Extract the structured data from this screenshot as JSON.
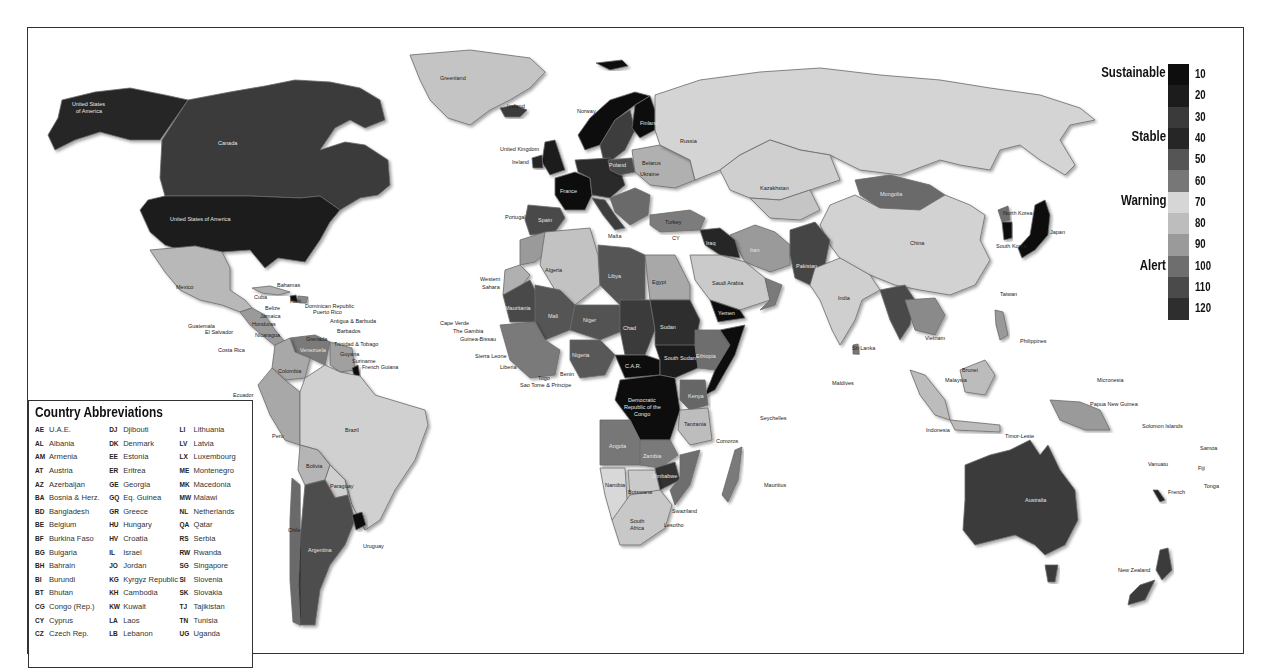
{
  "legend": {
    "categories": [
      {
        "label": "Sustainable",
        "top": 0
      },
      {
        "label": "Stable",
        "top": 64
      },
      {
        "label": "Warning",
        "top": 128
      },
      {
        "label": "Alert",
        "top": 193
      }
    ],
    "scale": [
      {
        "value": "10",
        "color": "#0e0e0e"
      },
      {
        "value": "20",
        "color": "#1c1c1c"
      },
      {
        "value": "30",
        "color": "#3a3a3a"
      },
      {
        "value": "40",
        "color": "#262626"
      },
      {
        "value": "50",
        "color": "#555555"
      },
      {
        "value": "60",
        "color": "#777777"
      },
      {
        "value": "70",
        "color": "#d6d6d6"
      },
      {
        "value": "80",
        "color": "#bdbdbd"
      },
      {
        "value": "90",
        "color": "#9a9a9a"
      },
      {
        "value": "100",
        "color": "#6e6e6e"
      },
      {
        "value": "110",
        "color": "#4a4a4a"
      },
      {
        "value": "120",
        "color": "#2e2e2e"
      }
    ]
  },
  "abbreviations": {
    "title": "Country Abbreviations",
    "columns": [
      [
        {
          "code": "AE",
          "name": "U.A.E."
        },
        {
          "code": "AL",
          "name": "Albania"
        },
        {
          "code": "AM",
          "name": "Armenia"
        },
        {
          "code": "AT",
          "name": "Austria"
        },
        {
          "code": "AZ",
          "name": "Azerbaijan"
        },
        {
          "code": "BA",
          "name": "Bosnia & Herz."
        },
        {
          "code": "BD",
          "name": "Bangladesh"
        },
        {
          "code": "BE",
          "name": "Belgium"
        },
        {
          "code": "BF",
          "name": "Burkina Faso"
        },
        {
          "code": "BG",
          "name": "Bulgaria"
        },
        {
          "code": "BH",
          "name": "Bahrain"
        },
        {
          "code": "BI",
          "name": "Burundi"
        },
        {
          "code": "BT",
          "name": "Bhutan"
        },
        {
          "code": "CG",
          "name": "Congo (Rep.)"
        },
        {
          "code": "CY",
          "name": "Cyprus"
        },
        {
          "code": "CZ",
          "name": "Czech Rep."
        }
      ],
      [
        {
          "code": "DJ",
          "name": "Djibouti"
        },
        {
          "code": "DK",
          "name": "Denmark"
        },
        {
          "code": "EE",
          "name": "Estonia"
        },
        {
          "code": "ER",
          "name": "Eritrea"
        },
        {
          "code": "GE",
          "name": "Georgia"
        },
        {
          "code": "GQ",
          "name": "Eq. Guinea"
        },
        {
          "code": "GR",
          "name": "Greece"
        },
        {
          "code": "HU",
          "name": "Hungary"
        },
        {
          "code": "HV",
          "name": "Croatia"
        },
        {
          "code": "IL",
          "name": "Israel"
        },
        {
          "code": "JO",
          "name": "Jordan"
        },
        {
          "code": "KG",
          "name": "Kyrgyz Republic"
        },
        {
          "code": "KH",
          "name": "Cambodia"
        },
        {
          "code": "KW",
          "name": "Kuwait"
        },
        {
          "code": "LA",
          "name": "Laos"
        },
        {
          "code": "LB",
          "name": "Lebanon"
        }
      ],
      [
        {
          "code": "LI",
          "name": "Lithuania"
        },
        {
          "code": "LV",
          "name": "Latvia"
        },
        {
          "code": "LX",
          "name": "Luxembourg"
        },
        {
          "code": "ME",
          "name": "Montenegro"
        },
        {
          "code": "MK",
          "name": "Macedonia"
        },
        {
          "code": "MW",
          "name": "Malawi"
        },
        {
          "code": "NL",
          "name": "Netherlands"
        },
        {
          "code": "QA",
          "name": "Qatar"
        },
        {
          "code": "RS",
          "name": "Serbia"
        },
        {
          "code": "RW",
          "name": "Rwanda"
        },
        {
          "code": "SG",
          "name": "Singapore"
        },
        {
          "code": "SI",
          "name": "Slovenia"
        },
        {
          "code": "SK",
          "name": "Slovakia"
        },
        {
          "code": "TJ",
          "name": "Tajikistan"
        },
        {
          "code": "TN",
          "name": "Tunisia"
        },
        {
          "code": "UG",
          "name": "Uganda"
        }
      ]
    ]
  },
  "map": {
    "labels": {
      "usa": "United States of America",
      "alaska1": "United States",
      "alaska2": "of America",
      "canada": "Canada",
      "greenland": "Greenland",
      "iceland": "Iceland",
      "mexico": "Mexico",
      "bahamas": "Bahamas",
      "cuba": "Cuba",
      "haiti": "Haiti",
      "dominican": "Dominican Republic",
      "puerto_rico": "Puerto Rico",
      "antigua": "Antigua & Barbuda",
      "jamaica": "Jamaica",
      "belize": "Belize",
      "honduras": "Honduras",
      "guatemala": "Guatemala",
      "el_salvador": "El Salvador",
      "nicaragua": "Nicaragua",
      "costa_rica": "Costa Rica",
      "panama": "Panama",
      "barbados": "Barbados",
      "grenada": "Grenada",
      "trinidad": "Trinidad & Tobago",
      "guyana": "Guyana",
      "suriname": "Suriname",
      "french_guiana": "French Guiana",
      "venezuela": "Venezuela",
      "colombia": "Colombia",
      "ecuador": "Ecuador",
      "peru": "Peru",
      "brazil": "Brazil",
      "bolivia": "Bolivia",
      "paraguay": "Paraguay",
      "chile": "Chile",
      "argentina": "Argentina",
      "uruguay": "Uruguay",
      "norway": "Norway",
      "sweden": "Sweden",
      "finland": "Finland",
      "uk": "United Kingdom",
      "ireland": "Ireland",
      "france": "France",
      "spain": "Spain",
      "portugal": "Portugal",
      "germany": "Germany",
      "poland": "Poland",
      "belarus": "Belarus",
      "ukraine": "Ukraine",
      "italy": "Italy",
      "malta": "Malta",
      "turkey": "Turkey",
      "russia": "Russia",
      "kazakhstan": "Kazakhstan",
      "uzbekistan": "Uzbekistan",
      "turkmenistan": "Turkmenistan",
      "mongolia": "Mongolia",
      "china": "China",
      "north_korea": "North Korea",
      "south_korea": "South Korea",
      "japan": "Japan",
      "taiwan": "Taiwan",
      "iran": "Iran",
      "iraq": "Iraq",
      "syria": "Syria",
      "afghanistan": "Afghanistan",
      "pakistan": "Pakistan",
      "india": "India",
      "saudi": "Saudi Arabia",
      "yemen": "Yemen",
      "oman": "Oman",
      "morocco": "Morocco",
      "algeria": "Algeria",
      "libya": "Libya",
      "egypt": "Egypt",
      "western_sahara1": "Western",
      "western_sahara2": "Sahara",
      "mauritania": "Mauritania",
      "mali": "Mali",
      "niger": "Niger",
      "chad": "Chad",
      "sudan": "Sudan",
      "south_sudan": "South Sudan",
      "eritrea": "ER",
      "ethiopia": "Ethiopia",
      "somalia": "Somalia",
      "nigeria": "Nigeria",
      "car": "C.A.R.",
      "drc1": "Democratic",
      "drc2": "Republic of the",
      "drc3": "Congo",
      "kenya": "Kenya",
      "tanzania": "Tanzania",
      "angola": "Angola",
      "zambia": "Zambia",
      "zimbabwe": "Zimbabwe",
      "mozambique": "Mozambique",
      "namibia": "Namibia",
      "botswana": "Botswana",
      "south_africa1": "South",
      "south_africa2": "Africa",
      "swaziland": "Swaziland",
      "lesotho": "Lesotho",
      "madagascar": "Madagascar",
      "comoros": "Comoros",
      "mauritius": "Mauritius",
      "seychelles": "Seychelles",
      "maldives": "Maldives",
      "sri_lanka": "Sri Lanka",
      "cape_verde": "Cape Verde",
      "gambia": "The Gambia",
      "guinea_bissau": "Guinea-Bissau",
      "sierra_leone": "Sierra Leone",
      "liberia": "Liberia",
      "togo": "Togo",
      "benin": "Benin",
      "sao_tome": "Sao Tome & Principe",
      "senegal": "Senegal",
      "myanmar": "Myanmar",
      "thailand": "Thailand",
      "vietnam": "Vietnam",
      "philippines": "Philippines",
      "brunei": "Brunei",
      "malaysia": "Malaysia",
      "indonesia": "Indonesia",
      "timor": "Timor-Leste",
      "micronesia": "Micronesia",
      "png": "Papua New Guinea",
      "solomon": "Solomon Islands",
      "samoa": "Samoa",
      "vanuatu": "Vanuatu",
      "fiji": "Fiji",
      "tonga": "Tonga",
      "french": "French",
      "australia": "Australia",
      "new_zealand": "New Zealand",
      "cy": "CY",
      "sg": "SG"
    }
  }
}
